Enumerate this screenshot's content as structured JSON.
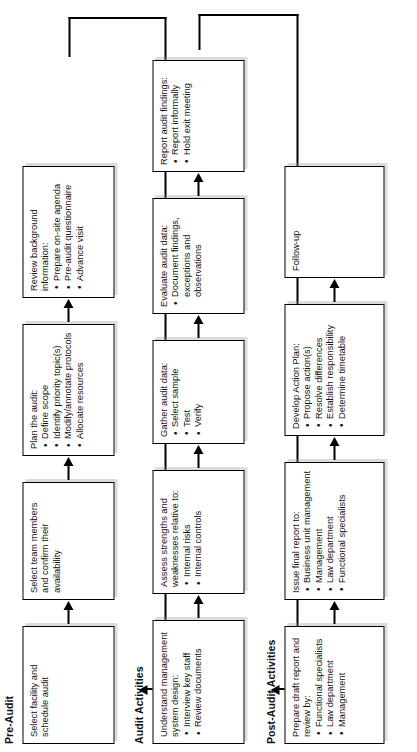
{
  "diagram": {
    "orientation": "rotated-90-ccw",
    "bands": [
      {
        "id": "pre-audit",
        "title": "Pre-Audit",
        "nodes": [
          {
            "id": "select-facility",
            "head": "Select facility and schedule audit",
            "bullets": []
          },
          {
            "id": "select-team",
            "head": "Select team members and confirm their availability",
            "bullets": []
          },
          {
            "id": "plan-audit",
            "head": "Plan the audit:",
            "bullets": [
              "Define scope",
              "Identify priority topic(s)",
              "Modify/annotate protocols",
              "Allocate resources"
            ]
          },
          {
            "id": "review-background",
            "head": "Review background information:",
            "bullets": [
              "Prepare on-site agenda",
              "Pre-audit questionnaire",
              "Advance visit"
            ]
          }
        ]
      },
      {
        "id": "audit-activities",
        "title": "Audit Activities",
        "nodes": [
          {
            "id": "understand-system",
            "head": "Understand management system design:",
            "bullets": [
              "Interview key staff",
              "Review documents"
            ]
          },
          {
            "id": "assess-strengths",
            "head": "Assess strengths and weaknesses relative to:",
            "bullets": [
              "Internal risks",
              "Internal controls"
            ]
          },
          {
            "id": "gather-data",
            "head": "Gather audit data:",
            "bullets": [
              "Select sample",
              "Test",
              "Verify"
            ]
          },
          {
            "id": "evaluate-data",
            "head": "Evaluate audit data:",
            "bullets": [
              "Document findings, exceptions and observations"
            ]
          },
          {
            "id": "report-findings",
            "head": "Report audit findings:",
            "bullets": [
              "Report informally",
              "Hold exit meeting"
            ]
          }
        ]
      },
      {
        "id": "post-audit",
        "title": "Post-Audit Activities",
        "nodes": [
          {
            "id": "prepare-draft",
            "head": "Prepare draft report and review by:",
            "bullets": [
              "Functional specialists",
              "Law department",
              "Management"
            ]
          },
          {
            "id": "issue-final",
            "head": "Issue final report to:",
            "bullets": [
              "Business unit management",
              "Management",
              "Law department",
              "Functional specialists"
            ]
          },
          {
            "id": "develop-action-plan",
            "head": "Develop Action Plan:",
            "bullets": [
              "Propose action(s)",
              "Resolve differences",
              "Establish responsibility",
              "Determine timetable"
            ]
          },
          {
            "id": "follow-up",
            "head": "Follow-up",
            "bullets": []
          }
        ]
      }
    ],
    "colors": {
      "ink": "#000000",
      "paper": "#ffffff",
      "shadow": "#969696"
    }
  }
}
